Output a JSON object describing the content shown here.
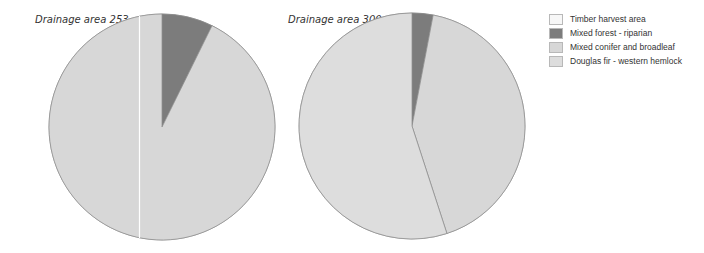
{
  "chart_data": {
    "type": "pie",
    "legend": {
      "placement": "top-right",
      "entries": [
        {
          "label": "Timber harvest area",
          "color": "#f7f7f7"
        },
        {
          "label": "Mixed forest - riparian",
          "color": "#7c7c7c"
        },
        {
          "label": "Mixed conifer and broadleaf",
          "color": "#d7d7d7"
        },
        {
          "label": "Douglas fir - western hemlock",
          "color": "#dddddd"
        }
      ]
    },
    "charts": [
      {
        "title": "Drainage area 253",
        "slices": [
          {
            "label": "Timber harvest area",
            "value": 0
          },
          {
            "label": "Mixed forest - riparian",
            "value": 7.3
          },
          {
            "label": "Mixed conifer and broadleaf",
            "value": 92.7
          },
          {
            "label": "Douglas fir - western hemlock",
            "value": 0
          }
        ],
        "start_angle_deg": 0,
        "direction": "clockwise"
      },
      {
        "title": "Drainage area 300",
        "slices": [
          {
            "label": "Timber harvest area",
            "value": 0
          },
          {
            "label": "Mixed forest - riparian",
            "value": 3
          },
          {
            "label": "Mixed conifer and broadleaf",
            "value": 42
          },
          {
            "label": "Douglas fir - western hemlock",
            "value": 55
          }
        ],
        "start_angle_deg": 0,
        "direction": "clockwise"
      }
    ]
  }
}
